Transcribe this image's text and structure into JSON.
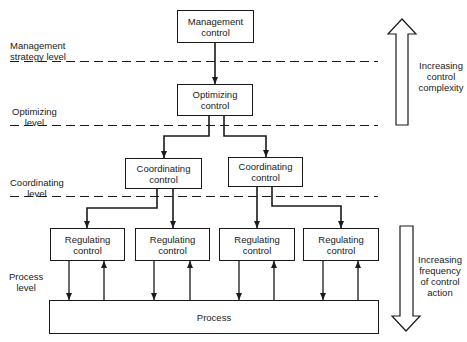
{
  "diagram": {
    "type": "hierarchical control diagram",
    "levels": [
      {
        "id": "management",
        "label": "Management\nstrategy level"
      },
      {
        "id": "optimizing",
        "label": "Optimizing\nlevel"
      },
      {
        "id": "coordinating",
        "label": "Coordinating\nlevel"
      },
      {
        "id": "process",
        "label": "Process\nlevel"
      }
    ],
    "nodes": {
      "management": "Management\ncontrol",
      "optimizing": "Optimizing\ncontrol",
      "coordinating": [
        "Coordinating\ncontrol",
        "Coordinating\ncontrol"
      ],
      "regulating": [
        "Regulating\ncontrol",
        "Regulating\ncontrol",
        "Regulating\ncontrol",
        "Regulating\ncontrol"
      ],
      "process": "Process"
    },
    "edges": [
      {
        "from": "management",
        "to": "optimizing"
      },
      {
        "from": "optimizing",
        "to": "coordinating.0"
      },
      {
        "from": "optimizing",
        "to": "coordinating.1"
      },
      {
        "from": "coordinating.0",
        "to": "regulating.0"
      },
      {
        "from": "coordinating.0",
        "to": "regulating.1"
      },
      {
        "from": "coordinating.1",
        "to": "regulating.2"
      },
      {
        "from": "coordinating.1",
        "to": "regulating.3"
      },
      {
        "from": "regulating.*",
        "to": "process",
        "bidirectional": true
      }
    ],
    "side_annotations": {
      "up": "Increasing\ncontrol\ncomplexity",
      "down": "Increasing\nfrequency\nof control\naction"
    }
  }
}
